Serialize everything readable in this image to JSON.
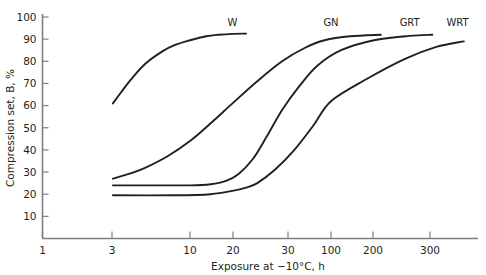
{
  "chart_data": {
    "type": "line",
    "title": "",
    "xlabel": "Exposure at −10°C, h",
    "ylabel": "Compression set, B, %",
    "xscale": "log",
    "xlim": [
      1,
      400
    ],
    "ylim": [
      0,
      100
    ],
    "grid": false,
    "legend_position": "inline-end-of-curve",
    "xticks": [
      1,
      3,
      10,
      20,
      30,
      100,
      200,
      300
    ],
    "xtick_labels": [
      "1",
      "3",
      "10",
      "20",
      "30",
      "100",
      "200",
      "300"
    ],
    "yticks": [
      10,
      20,
      30,
      40,
      50,
      60,
      70,
      80,
      90,
      100
    ],
    "ytick_labels": [
      "10",
      "20",
      "30",
      "40",
      "50",
      "60",
      "70",
      "80",
      "90",
      "100"
    ],
    "series": [
      {
        "name": "W",
        "label": "W",
        "label_x": 20,
        "label_y": 96,
        "x": [
          3,
          3.5,
          4,
          5,
          6.5,
          8,
          10,
          13,
          16,
          20,
          25
        ],
        "y": [
          61,
          67,
          72,
          79,
          84.5,
          87.5,
          89.5,
          91.3,
          92,
          92.4,
          92.5
        ]
      },
      {
        "name": "GN",
        "label": "GN",
        "label_x": 100,
        "label_y": 96,
        "x": [
          3,
          4,
          5,
          7,
          10,
          14,
          20,
          30,
          45,
          65,
          90,
          120,
          160
        ],
        "y": [
          27,
          29.5,
          32,
          37,
          44,
          52,
          61,
          71,
          80,
          86,
          89.5,
          91.3,
          92
        ],
        "end_label_x": 160
      },
      {
        "name": "GRT",
        "label": "GRT",
        "label_x": 210,
        "label_y": 96,
        "x": [
          3,
          6,
          10,
          14,
          18,
          22,
          28,
          35,
          45,
          60,
          80,
          110,
          150,
          210,
          260
        ],
        "y": [
          24,
          24,
          24,
          24.5,
          26,
          29,
          36,
          46,
          58,
          69,
          78,
          85,
          89.5,
          91.5,
          92
        ]
      },
      {
        "name": "WRT",
        "label": "WRT",
        "label_x": 330,
        "label_y": 96,
        "x": [
          3,
          8,
          14,
          20,
          25,
          30,
          40,
          55,
          75,
          100,
          140,
          200,
          270,
          350
        ],
        "y": [
          19.5,
          19.5,
          20,
          21.5,
          23,
          25,
          31,
          40,
          51,
          62,
          72,
          81,
          86.5,
          89
        ]
      }
    ]
  },
  "colors": {
    "curve": "#231f20",
    "axis": "#7f7f7f",
    "text": "#231f20",
    "background": "#ffffff"
  }
}
